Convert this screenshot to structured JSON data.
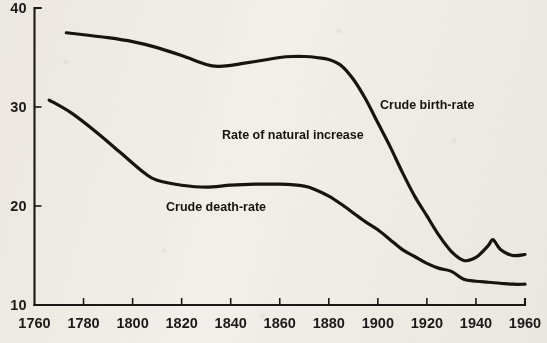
{
  "chart_data": {
    "type": "line",
    "title": "",
    "subtitle": "",
    "xlabel": "",
    "ylabel": "",
    "xlim": [
      1760,
      1960
    ],
    "ylim": [
      10,
      40
    ],
    "grid": false,
    "legend_position": "inline-annotations",
    "x_ticks": [
      1760,
      1780,
      1800,
      1820,
      1840,
      1860,
      1880,
      1900,
      1920,
      1940,
      1960
    ],
    "x_tick_labels": [
      "1760",
      "1780",
      "1800",
      "1820",
      "1840",
      "1860",
      "1880",
      "1900",
      "1920",
      "1940",
      "1960"
    ],
    "y_ticks": [
      10,
      20,
      30,
      40
    ],
    "y_tick_labels": [
      "10",
      "20",
      "30",
      "40"
    ],
    "series": [
      {
        "name": "Crude birth-rate",
        "x": [
          1773,
          1780,
          1790,
          1800,
          1810,
          1820,
          1830,
          1835,
          1840,
          1845,
          1850,
          1855,
          1860,
          1865,
          1870,
          1875,
          1880,
          1885,
          1890,
          1895,
          1900,
          1905,
          1910,
          1915,
          1920,
          1925,
          1930,
          1935,
          1940,
          1945,
          1947,
          1950,
          1955,
          1960
        ],
        "y": [
          37.5,
          37.3,
          37.0,
          36.6,
          36.0,
          35.2,
          34.3,
          34.1,
          34.2,
          34.4,
          34.6,
          34.8,
          35.0,
          35.1,
          35.1,
          35.0,
          34.8,
          34.2,
          32.8,
          30.8,
          28.4,
          26.0,
          23.4,
          21.0,
          19.0,
          17.0,
          15.4,
          14.5,
          14.8,
          16.0,
          16.6,
          15.6,
          15.0,
          15.1
        ]
      },
      {
        "name": "Crude death-rate",
        "x": [
          1766,
          1775,
          1785,
          1795,
          1805,
          1810,
          1820,
          1830,
          1840,
          1850,
          1860,
          1870,
          1875,
          1880,
          1885,
          1890,
          1895,
          1900,
          1905,
          1910,
          1915,
          1920,
          1925,
          1930,
          1935,
          1940,
          1945,
          1950,
          1955,
          1960
        ],
        "y": [
          30.7,
          29.4,
          27.5,
          25.4,
          23.3,
          22.6,
          22.1,
          21.9,
          22.1,
          22.2,
          22.2,
          22.0,
          21.6,
          21.0,
          20.2,
          19.3,
          18.4,
          17.6,
          16.6,
          15.6,
          14.9,
          14.2,
          13.7,
          13.4,
          12.6,
          12.4,
          12.3,
          12.2,
          12.1,
          12.1
        ]
      }
    ],
    "annotations": [
      {
        "text": "Crude birth-rate",
        "x_px": 380,
        "y_px": 109
      },
      {
        "text": "Rate of natural increase",
        "x_px": 222,
        "y_px": 139
      },
      {
        "text": "Crude death-rate",
        "x_px": 166,
        "y_px": 211
      }
    ],
    "colors": {
      "background": "#f4f2ee",
      "ink": "#16140f",
      "axis": "#1b1917"
    }
  }
}
